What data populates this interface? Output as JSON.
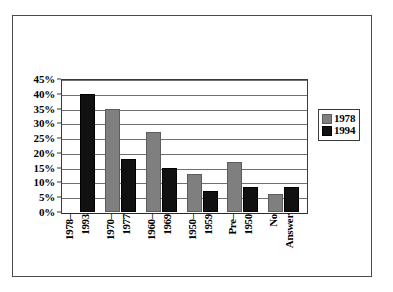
{
  "chart_data": {
    "type": "bar",
    "title": "",
    "xlabel": "",
    "ylabel": "",
    "ylim": [
      0,
      45
    ],
    "ytick_labels": [
      "45%",
      "40%",
      "35%",
      "30%",
      "25%",
      "20%",
      "15%",
      "10%",
      "5%",
      "0%"
    ],
    "ytick_values": [
      45,
      40,
      35,
      30,
      25,
      20,
      15,
      10,
      5,
      0
    ],
    "grid": true,
    "legend_position": "right",
    "categories": [
      "1978–1993",
      "1970–1977",
      "1960–1969",
      "1950–1959",
      "Pre–1950",
      "No Answer"
    ],
    "category_lines": [
      [
        "1978–",
        "1993"
      ],
      [
        "1970–",
        "1977"
      ],
      [
        "1960–",
        "1969"
      ],
      [
        "1950–",
        "1959"
      ],
      [
        "Pre–",
        "1950"
      ],
      [
        "No",
        "Answer"
      ]
    ],
    "series": [
      {
        "name": "1978",
        "color": "#7f7f7f",
        "values": [
          0,
          35,
          27,
          13,
          17,
          6
        ]
      },
      {
        "name": "1994",
        "color": "#111111",
        "values": [
          40,
          18,
          15,
          7,
          8.5,
          8.5
        ]
      }
    ]
  },
  "legend": {
    "items": [
      {
        "label": "1978",
        "swatch": "gray-swatch-icon"
      },
      {
        "label": "1994",
        "swatch": "black-swatch-icon"
      }
    ]
  }
}
